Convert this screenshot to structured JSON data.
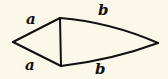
{
  "diagram": {
    "type": "kite",
    "stroke_color": "#111111",
    "background": "#fbf8ea",
    "vertices": {
      "left": [
        13,
        42
      ],
      "top": [
        60,
        18
      ],
      "bottom": [
        61,
        66
      ],
      "right": [
        158,
        43
      ]
    },
    "labels": {
      "upper_left_side": "a",
      "lower_left_side": "a",
      "upper_right_side": "b",
      "lower_right_side": "b"
    }
  }
}
